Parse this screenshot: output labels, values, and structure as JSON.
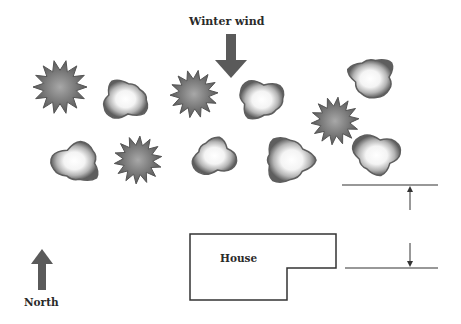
{
  "labels": {
    "wind": "Winter wind",
    "north": "North",
    "house": "House"
  },
  "colors": {
    "background": "#ffffff",
    "evergreen_fill": "#6e6e6e",
    "evergreen_center": "#9a9a9a",
    "deciduous_edge": "#5e5e5e",
    "deciduous_center": "#ffffff",
    "arrow_fill": "#5a5a5a",
    "line": "#333333"
  },
  "plants": {
    "evergreens": [
      {
        "x": 60,
        "y": 87,
        "r": 27
      },
      {
        "x": 194,
        "y": 94,
        "r": 24
      },
      {
        "x": 335,
        "y": 121,
        "r": 24
      },
      {
        "x": 138,
        "y": 160,
        "r": 24
      }
    ],
    "deciduous": [
      {
        "x": 125,
        "y": 100,
        "r": 26
      },
      {
        "x": 261,
        "y": 99,
        "r": 26
      },
      {
        "x": 372,
        "y": 77,
        "r": 26
      },
      {
        "x": 76,
        "y": 163,
        "r": 27
      },
      {
        "x": 215,
        "y": 157,
        "r": 24
      },
      {
        "x": 287,
        "y": 160,
        "r": 29
      },
      {
        "x": 377,
        "y": 154,
        "r": 26
      }
    ]
  },
  "house": {
    "points": "190,234 336,234 336,268 287,268 287,300 190,300"
  },
  "measurement": {
    "top_line": {
      "x1": 342,
      "x2": 438,
      "y": 185
    },
    "bottom_line": {
      "x1": 345,
      "x2": 438,
      "y": 268
    },
    "arrow_x": 410
  }
}
